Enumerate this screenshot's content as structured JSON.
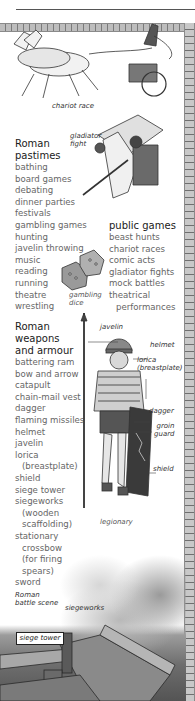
{
  "captions": {
    "chariot_race": "chariot race",
    "gladiator_fight": [
      "gladiator",
      "fight"
    ],
    "gambling_dice": [
      "gambling",
      "dice"
    ],
    "legionary": "legionary",
    "battle_scene": [
      "Roman",
      "battle scene"
    ],
    "siegeworks": "siegeworks",
    "siege_tower": "siege tower"
  },
  "legionary_labels": {
    "javelin": "javelin",
    "helmet": "helmet",
    "lorica": [
      "lorica",
      "(breastplate)"
    ],
    "dagger": "dagger",
    "groin_guard": [
      "groin",
      "guard"
    ],
    "shield": "shield"
  },
  "pastimes": {
    "heading": [
      "Roman",
      "pastimes"
    ],
    "items": [
      "bathing",
      "board games",
      "debating",
      "dinner parties",
      "festivals",
      "gambling games",
      "hunting",
      "javelin throwing",
      "music",
      "reading",
      "running",
      "theatre",
      "wrestling"
    ]
  },
  "public_games": {
    "heading": "public games",
    "items": [
      "beast hunts",
      "chariot races",
      "comic acts",
      "gladiator fights",
      "mock battles",
      "theatrical",
      "performances"
    ]
  },
  "weapons": {
    "heading": [
      "Roman",
      "weapons",
      "and armour"
    ],
    "items": [
      "battering ram",
      "bow and arrow",
      "catapult",
      "chain-mail vest",
      "dagger",
      "flaming missiles",
      "helmet",
      "javelin",
      "lorica",
      "(breastplate)",
      "shield",
      "siege tower",
      "siegeworks",
      "(wooden",
      "scaffolding)",
      "stationary",
      "crossbow",
      "(for firing",
      "spears)",
      "sword"
    ]
  }
}
